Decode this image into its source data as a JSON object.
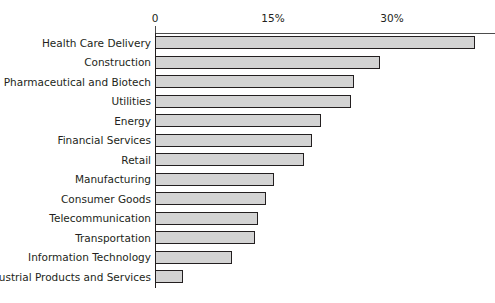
{
  "chart_data": {
    "type": "bar",
    "orientation": "horizontal",
    "title": "",
    "subtitle": "",
    "xlabel": "",
    "ylabel": "",
    "xlim": [
      0,
      43
    ],
    "grid": false,
    "legend": null,
    "tick_labels": [
      "0",
      "15%",
      "30%"
    ],
    "tick_values": [
      0,
      15,
      30
    ],
    "bar_color": "#d3d3d3",
    "bar_border_color": "#231f20",
    "text_color": "#231f20",
    "axis_color": "#231f20",
    "categories": [
      "Health Care Delivery",
      "Construction",
      "Pharmaceutical and Biotech",
      "Utilities",
      "Energy",
      "Financial Services",
      "Retail",
      "Manufacturing",
      "Consumer Goods",
      "Telecommunication",
      "Transportation",
      "Information Technology",
      "Industrial Products and Services"
    ],
    "values": [
      40.5,
      28.4,
      25.2,
      24.8,
      21.0,
      19.9,
      18.8,
      15.0,
      14.1,
      13.0,
      12.6,
      9.8,
      3.5
    ],
    "bars": [
      {
        "label": "Health Care Delivery",
        "value": 40.5
      },
      {
        "label": "Construction",
        "value": 28.4
      },
      {
        "label": "Pharmaceutical and Biotech",
        "value": 25.2
      },
      {
        "label": "Utilities",
        "value": 24.8
      },
      {
        "label": "Energy",
        "value": 21.0
      },
      {
        "label": "Financial Services",
        "value": 19.9
      },
      {
        "label": "Retail",
        "value": 18.8
      },
      {
        "label": "Manufacturing",
        "value": 15.0
      },
      {
        "label": "Consumer Goods",
        "value": 14.1
      },
      {
        "label": "Telecommunication",
        "value": 13.0
      },
      {
        "label": "Transportation",
        "value": 12.6
      },
      {
        "label": "Information Technology",
        "value": 9.8
      },
      {
        "label": "Industrial Products and Services",
        "value": 3.5
      }
    ]
  }
}
